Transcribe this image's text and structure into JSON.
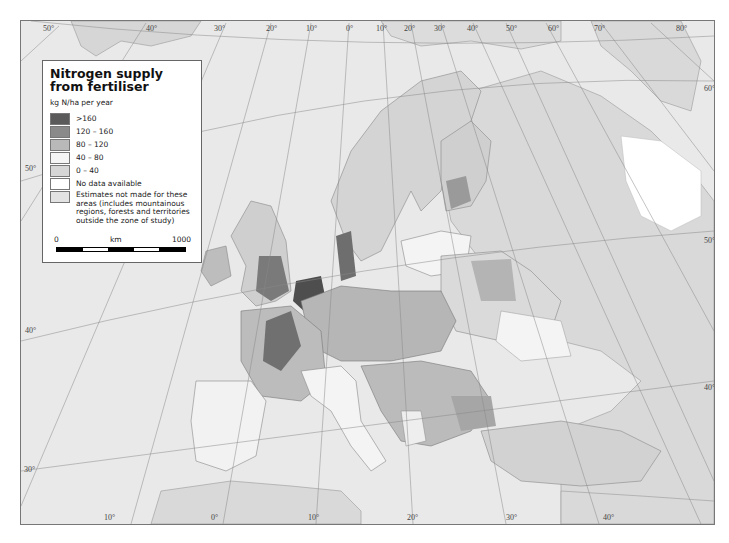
{
  "legend": {
    "title": "Nitrogen supply from fertiliser",
    "unit": "kg N/ha per year",
    "classes": [
      {
        "label": ">160",
        "color": "#5a5a5a"
      },
      {
        "label": "120 – 160",
        "color": "#8a8a8a"
      },
      {
        "label": "80 – 120",
        "color": "#b9b9b9"
      },
      {
        "label": "40 – 80",
        "color": "#f4f4f4"
      },
      {
        "label": "0 – 40",
        "color": "#d6d6d6"
      },
      {
        "label": "No data available",
        "color": "#ffffff"
      },
      {
        "label": "Estimates not made for these areas (includes mountainous regions, forests and territories outside the zone of study)",
        "color": "#e2e2e2"
      }
    ],
    "scale": {
      "start": "0",
      "unit": "km",
      "end": "1000"
    }
  },
  "graticule": {
    "top": [
      "50°",
      "40°",
      "30°",
      "20°",
      "10°",
      "0°",
      "10°",
      "20°",
      "30°",
      "40°",
      "50°",
      "60°",
      "70°",
      "80°"
    ],
    "bottom": [
      "10°",
      "0°",
      "10°",
      "20°",
      "30°",
      "40°"
    ],
    "left": [
      "50°",
      "40°",
      "30°"
    ],
    "right": [
      "60°",
      "50°",
      "40°"
    ]
  },
  "colors": {
    "sea": "#e9e9e9",
    "land_default": "#d9d9d9",
    "very_high": "#5a5a5a",
    "high": "#8a8a8a",
    "medium": "#b9b9b9",
    "low": "#f4f4f4"
  }
}
